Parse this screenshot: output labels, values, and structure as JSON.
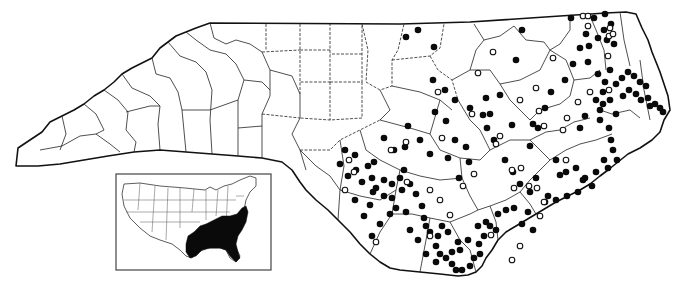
{
  "map": {
    "subject": "North Carolina county distribution map",
    "legend_symbols": {
      "filled_dot": "record (filled circle)",
      "open_dot": "record (open circle)"
    },
    "colors": {
      "ink": "#0a0a0a",
      "paper": "#ffffff"
    },
    "filled_dots": [
      [
        571,
        18
      ],
      [
        594,
        18
      ],
      [
        605,
        14
      ],
      [
        611,
        24
      ],
      [
        586,
        34
      ],
      [
        598,
        38
      ],
      [
        604,
        30
      ],
      [
        589,
        46
      ],
      [
        580,
        48
      ],
      [
        607,
        40
      ],
      [
        614,
        44
      ],
      [
        588,
        62
      ],
      [
        573,
        64
      ],
      [
        565,
        80
      ],
      [
        598,
        74
      ],
      [
        610,
        70
      ],
      [
        605,
        82
      ],
      [
        616,
        84
      ],
      [
        622,
        78
      ],
      [
        628,
        72
      ],
      [
        634,
        76
      ],
      [
        640,
        82
      ],
      [
        603,
        92
      ],
      [
        596,
        100
      ],
      [
        603,
        104
      ],
      [
        600,
        110
      ],
      [
        585,
        116
      ],
      [
        580,
        128
      ],
      [
        600,
        120
      ],
      [
        610,
        100
      ],
      [
        616,
        114
      ],
      [
        623,
        96
      ],
      [
        629,
        90
      ],
      [
        636,
        94
      ],
      [
        641,
        100
      ],
      [
        646,
        86
      ],
      [
        648,
        98
      ],
      [
        650,
        106
      ],
      [
        655,
        104
      ],
      [
        660,
        108
      ],
      [
        663,
        112
      ],
      [
        609,
        128
      ],
      [
        611,
        140
      ],
      [
        613,
        150
      ],
      [
        604,
        160
      ],
      [
        608,
        168
      ],
      [
        617,
        160
      ],
      [
        551,
        92
      ],
      [
        545,
        108
      ],
      [
        538,
        128
      ],
      [
        522,
        30
      ],
      [
        516,
        60
      ],
      [
        500,
        95
      ],
      [
        483,
        115
      ],
      [
        470,
        108
      ],
      [
        455,
        100
      ],
      [
        446,
        121
      ],
      [
        455,
        140
      ],
      [
        448,
        158
      ],
      [
        459,
        178
      ],
      [
        469,
        162
      ],
      [
        466,
        147
      ],
      [
        487,
        128
      ],
      [
        494,
        140
      ],
      [
        505,
        160
      ],
      [
        513,
        172
      ],
      [
        520,
        184
      ],
      [
        530,
        192
      ],
      [
        536,
        178
      ],
      [
        548,
        196
      ],
      [
        556,
        160
      ],
      [
        560,
        175
      ],
      [
        566,
        172
      ],
      [
        576,
        168
      ],
      [
        585,
        178
      ],
      [
        592,
        186
      ],
      [
        596,
        172
      ],
      [
        514,
        208
      ],
      [
        528,
        212
      ],
      [
        522,
        224
      ],
      [
        533,
        230
      ],
      [
        545,
        202
      ],
      [
        556,
        200
      ],
      [
        567,
        196
      ],
      [
        578,
        192
      ],
      [
        583,
        180
      ],
      [
        406,
        37
      ],
      [
        418,
        30
      ],
      [
        434,
        47
      ],
      [
        433,
        80
      ],
      [
        445,
        90
      ],
      [
        435,
        112
      ],
      [
        430,
        154
      ],
      [
        345,
        150
      ],
      [
        355,
        155
      ],
      [
        340,
        164
      ],
      [
        368,
        166
      ],
      [
        374,
        162
      ],
      [
        356,
        170
      ],
      [
        373,
        192
      ],
      [
        370,
        205
      ],
      [
        355,
        200
      ],
      [
        364,
        216
      ],
      [
        372,
        236
      ],
      [
        380,
        224
      ],
      [
        390,
        214
      ],
      [
        396,
        208
      ],
      [
        406,
        212
      ],
      [
        410,
        230
      ],
      [
        418,
        240
      ],
      [
        424,
        218
      ],
      [
        426,
        226
      ],
      [
        362,
        182
      ],
      [
        372,
        178
      ],
      [
        384,
        180
      ],
      [
        392,
        184
      ],
      [
        400,
        178
      ],
      [
        404,
        170
      ],
      [
        410,
        184
      ],
      [
        416,
        194
      ],
      [
        422,
        206
      ],
      [
        430,
        232
      ],
      [
        436,
        246
      ],
      [
        440,
        254
      ],
      [
        446,
        258
      ],
      [
        452,
        264
      ],
      [
        456,
        270
      ],
      [
        462,
        270
      ],
      [
        470,
        266
      ],
      [
        474,
        258
      ],
      [
        480,
        254
      ],
      [
        479,
        244
      ],
      [
        484,
        236
      ],
      [
        490,
        226
      ],
      [
        498,
        214
      ],
      [
        506,
        210
      ],
      [
        448,
        232
      ],
      [
        458,
        242
      ],
      [
        452,
        252
      ],
      [
        438,
        236
      ],
      [
        442,
        226
      ],
      [
        426,
        254
      ],
      [
        436,
        262
      ],
      [
        460,
        250
      ],
      [
        468,
        240
      ],
      [
        478,
        226
      ],
      [
        486,
        222
      ],
      [
        496,
        230
      ],
      [
        384,
        196
      ],
      [
        376,
        188
      ],
      [
        392,
        198
      ],
      [
        402,
        190
      ],
      [
        384,
        138
      ],
      [
        394,
        150
      ],
      [
        405,
        147
      ],
      [
        348,
        176
      ],
      [
        408,
        126
      ],
      [
        420,
        140
      ],
      [
        486,
        98
      ],
      [
        490,
        114
      ],
      [
        512,
        125
      ],
      [
        530,
        146
      ],
      [
        533,
        124
      ]
    ],
    "open_dots": [
      [
        583,
        16
      ],
      [
        588,
        16
      ],
      [
        588,
        26
      ],
      [
        609,
        36
      ],
      [
        613,
        34
      ],
      [
        608,
        56
      ],
      [
        609,
        90
      ],
      [
        590,
        92
      ],
      [
        567,
        118
      ],
      [
        578,
        102
      ],
      [
        610,
        28
      ],
      [
        553,
        58
      ],
      [
        536,
        88
      ],
      [
        539,
        111
      ],
      [
        520,
        100
      ],
      [
        472,
        114
      ],
      [
        438,
        92
      ],
      [
        478,
        73
      ],
      [
        493,
        52
      ],
      [
        544,
        126
      ],
      [
        544,
        202
      ],
      [
        563,
        130
      ],
      [
        566,
        160
      ],
      [
        407,
        182
      ],
      [
        406,
        142
      ],
      [
        391,
        150
      ],
      [
        349,
        160
      ],
      [
        354,
        172
      ],
      [
        440,
        200
      ],
      [
        430,
        190
      ],
      [
        450,
        215
      ],
      [
        345,
        190
      ],
      [
        430,
        236
      ],
      [
        376,
        242
      ],
      [
        463,
        186
      ],
      [
        496,
        144
      ],
      [
        514,
        188
      ],
      [
        500,
        136
      ],
      [
        442,
        138
      ],
      [
        474,
        174
      ],
      [
        521,
        168
      ],
      [
        529,
        186
      ],
      [
        540,
        216
      ],
      [
        512,
        170
      ],
      [
        491,
        235
      ],
      [
        520,
        246
      ],
      [
        512,
        260
      ],
      [
        537,
        188
      ]
    ],
    "inset": {
      "label": "United States locator inset",
      "highlighted_region": "Southeastern US range"
    }
  }
}
